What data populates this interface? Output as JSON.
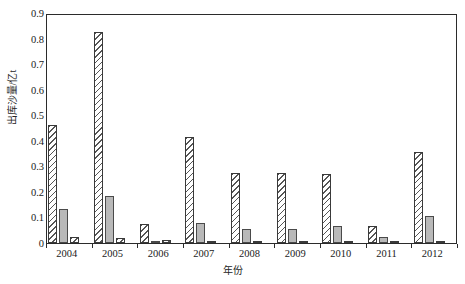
{
  "chart_data": {
    "type": "bar",
    "title": "",
    "xlabel": "年份",
    "ylabel": "出库沙量/亿t",
    "categories": [
      "2004",
      "2005",
      "2006",
      "2007",
      "2008",
      "2009",
      "2010",
      "2011",
      "2012"
    ],
    "ylim": [
      0,
      0.9
    ],
    "ytick_labels": [
      "0",
      "0.1",
      "0.2",
      "0.3",
      "0.4",
      "0.5",
      "0.6",
      "0.7",
      "0.8",
      "0.9"
    ],
    "ytick_values": [
      0,
      0.1,
      0.2,
      0.3,
      0.4,
      0.5,
      0.6,
      0.7,
      0.8,
      0.9
    ],
    "grid": false,
    "legend": "none",
    "series": [
      {
        "name": "series-1",
        "style": "hatched",
        "values": [
          0.46,
          0.825,
          0.075,
          0.415,
          0.275,
          0.275,
          0.27,
          0.065,
          0.355
        ]
      },
      {
        "name": "series-2",
        "style": "solid-gray",
        "values": [
          0.135,
          0.185,
          0.005,
          0.08,
          0.055,
          0.055,
          0.065,
          0.025,
          0.105
        ]
      },
      {
        "name": "series-3",
        "style": "hatched",
        "values": [
          0.025,
          0.018,
          0.01,
          0.004,
          0.004,
          0.004,
          0.004,
          0.004,
          0.008
        ]
      }
    ]
  }
}
